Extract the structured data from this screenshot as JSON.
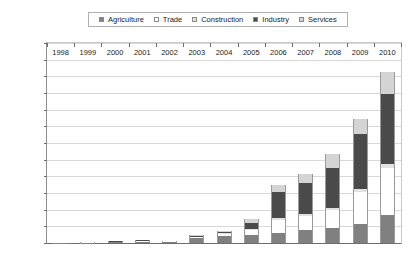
{
  "chart_data": {
    "type": "bar",
    "subtype": "stacked-column",
    "title": "",
    "xlabel": "",
    "ylabel": "",
    "categories": [
      "1998",
      "1999",
      "2000",
      "2001",
      "2002",
      "2003",
      "2004",
      "2005",
      "2006",
      "2007",
      "2008",
      "2009",
      "2010"
    ],
    "ylim": [
      0,
      60000
    ],
    "ytick_step": 5000,
    "ytick_labels": [
      "60,000",
      "55,000",
      "50,000",
      "45,000",
      "40,000",
      "35,000",
      "30,000",
      "25,000",
      "20,000",
      "15,000",
      "10,000",
      "5000",
      "0"
    ],
    "ytick_values": [
      60000,
      55000,
      50000,
      45000,
      40000,
      35000,
      30000,
      25000,
      20000,
      15000,
      10000,
      5000,
      0
    ],
    "grid": true,
    "legend_position": "top",
    "stack_order": [
      "Agriculture",
      "Trade",
      "Construction",
      "Industry",
      "Services"
    ],
    "series": [
      {
        "name": "Agriculture",
        "color": "#808080",
        "values": [
          60,
          120,
          260,
          420,
          340,
          1500,
          2000,
          2300,
          3100,
          3900,
          4600,
          5600,
          8400
        ]
      },
      {
        "name": "Trade",
        "color": "#ffffff",
        "values": [
          20,
          40,
          90,
          150,
          120,
          260,
          700,
          1500,
          3800,
          4200,
          5300,
          9600,
          14200
        ]
      },
      {
        "name": "Construction",
        "color": "#e2e2e2",
        "values": [
          10,
          20,
          40,
          60,
          50,
          100,
          200,
          300,
          500,
          600,
          700,
          900,
          1100
        ]
      },
      {
        "name": "Industry",
        "color": "#4a4a4a",
        "values": [
          20,
          50,
          110,
          180,
          150,
          340,
          500,
          1900,
          7900,
          9200,
          11800,
          16700,
          21000
        ]
      },
      {
        "name": "Services",
        "color": "#d4d4d4",
        "values": [
          10,
          20,
          50,
          90,
          70,
          200,
          300,
          1100,
          2100,
          2900,
          4400,
          4500,
          6500
        ]
      }
    ]
  },
  "legend": {
    "items": [
      {
        "label": "Agriculture",
        "color": "#808080"
      },
      {
        "label": "Trade",
        "color": "#ffffff"
      },
      {
        "label": "Construction",
        "color": "#e2e2e2"
      },
      {
        "label": "Industry",
        "color": "#4a4a4a"
      },
      {
        "label": "Services",
        "color": "#d4d4d4"
      }
    ]
  }
}
